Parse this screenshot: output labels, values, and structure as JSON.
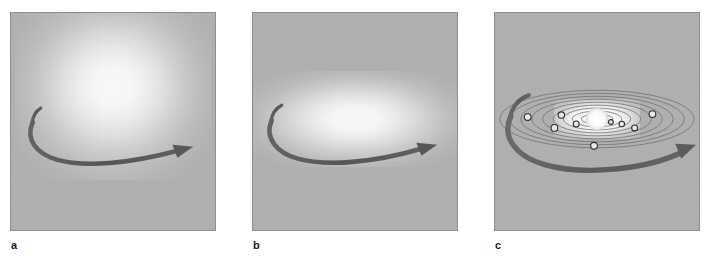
{
  "figure": {
    "background_color": "#ffffff",
    "panel_background_color": "#b2b2b2",
    "panel_border_color": "#8e8e8e",
    "arrow_color": "#5a5a5a",
    "orbit_color": "#6e6e6e",
    "glow_color": "#ffffff",
    "panel_count": 3
  },
  "panels": [
    {
      "label": "a",
      "stage": "spherical rotating gas cloud",
      "glow_shape": "sphere",
      "glow_center": [
        103,
        75
      ],
      "glow_size": [
        196,
        186
      ],
      "arrow": {
        "name": "rotation-arrow",
        "direction": "clockwise-sweep-right",
        "color": "#5a5a5a"
      },
      "orbit_count": 0,
      "planet_count": 0
    },
    {
      "label": "b",
      "stage": "flattened rotating disk",
      "glow_shape": "disk",
      "glow_center": [
        103,
        107
      ],
      "glow_size": [
        210,
        96
      ],
      "arrow": {
        "name": "rotation-arrow",
        "direction": "clockwise-sweep-right",
        "color": "#5a5a5a"
      },
      "orbit_count": 0,
      "planet_count": 0
    },
    {
      "label": "c",
      "stage": "formed solar system with planets on orbits",
      "glow_shape": "core",
      "glow_center": [
        103,
        107
      ],
      "glow_size": [
        86,
        40
      ],
      "arrow": {
        "name": "rotation-arrow",
        "direction": "clockwise-sweep-right",
        "color": "#5a5a5a"
      },
      "orbit_count": 9,
      "planet_count": 9
    }
  ],
  "chart_data": {
    "type": "diagram",
    "stages": [
      "a",
      "b",
      "c"
    ],
    "stage_descriptions": [
      "Spherical rotating cloud of gas and dust",
      "Cloud contracts and flattens into a rotating disk",
      "Central star forms with planets on concentric orbits"
    ],
    "sun": {
      "name": "central-sun",
      "cx": 103,
      "cy": 107,
      "rx": 11,
      "ry": 11,
      "fill": "#ffffff"
    },
    "orbits": [
      {
        "rx": 16,
        "ry": 5
      },
      {
        "rx": 25,
        "ry": 8
      },
      {
        "rx": 34,
        "ry": 11
      },
      {
        "rx": 44,
        "ry": 14
      },
      {
        "rx": 55,
        "ry": 17
      },
      {
        "rx": 66,
        "ry": 20
      },
      {
        "rx": 77,
        "ry": 23
      },
      {
        "rx": 88,
        "ry": 26
      },
      {
        "rx": 98,
        "ry": 29
      }
    ],
    "planets": [
      {
        "name": "planet-1",
        "cx": 117,
        "cy": 110,
        "r": 2.4,
        "orbit": 1
      },
      {
        "name": "planet-2",
        "cx": 82,
        "cy": 112,
        "r": 3.0,
        "orbit": 2
      },
      {
        "name": "planet-3",
        "cx": 128,
        "cy": 112,
        "r": 2.8,
        "orbit": 3
      },
      {
        "name": "planet-4",
        "cx": 67,
        "cy": 103,
        "r": 3.2,
        "orbit": 4
      },
      {
        "name": "planet-5",
        "cx": 141,
        "cy": 116,
        "r": 3.0,
        "orbit": 5
      },
      {
        "name": "planet-6",
        "cx": 60,
        "cy": 116,
        "r": 3.4,
        "orbit": 6
      },
      {
        "name": "planet-7",
        "cx": 159,
        "cy": 102,
        "r": 3.4,
        "orbit": 7
      },
      {
        "name": "planet-8",
        "cx": 33,
        "cy": 105,
        "r": 3.4,
        "orbit": 8
      },
      {
        "name": "planet-9",
        "cx": 100,
        "cy": 134,
        "r": 3.4,
        "orbit": 9
      }
    ]
  }
}
